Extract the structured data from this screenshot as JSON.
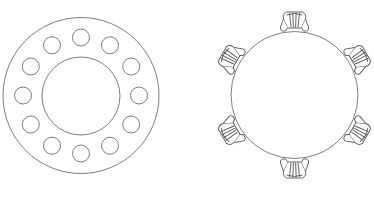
{
  "diagrams": [
    {
      "id": "round-banquet-layout",
      "label": "Round table with 12 seats (ring layout)",
      "outer_circle": {
        "cx": 81,
        "cy": 95.5,
        "r": 78
      },
      "inner_circle": {
        "cx": 81,
        "cy": 96,
        "r": 39
      },
      "seat_ring_radius": 58,
      "seat_radius": 8.5,
      "seat_count": 12
    },
    {
      "id": "round-table-with-chairs",
      "label": "Round table with 6 chairs",
      "table_circle": {
        "cx": 294.5,
        "cy": 95,
        "r": 63.5
      },
      "chair_distance": 70,
      "chair_count": 6,
      "chair_angles_deg": [
        -90,
        -30,
        30,
        90,
        150,
        210
      ]
    }
  ],
  "colors": {
    "background": "#ffffff",
    "stroke": "#6e6e6e",
    "chair_stroke": "#555555"
  }
}
